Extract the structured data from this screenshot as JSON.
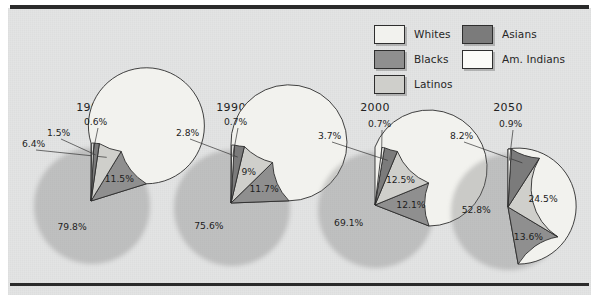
{
  "figure": {
    "background_color": "#e3e4e4",
    "rule_color": "#2b2b2b"
  },
  "legend": {
    "position": "top-right",
    "columns": [
      {
        "items": [
          {
            "label": "Whites",
            "color": "#f2f2ee",
            "name": "whites"
          },
          {
            "label": "Blacks",
            "color": "#8f8f8f",
            "name": "blacks"
          },
          {
            "label": "Latinos",
            "color": "#cfcfcb",
            "name": "latinos"
          }
        ]
      },
      {
        "items": [
          {
            "label": "Asians",
            "color": "#7b7b7b",
            "name": "asians"
          },
          {
            "label": "Am. Indians",
            "color": "#fbfbf8",
            "name": "am-indians"
          }
        ]
      }
    ]
  },
  "chart_data": {
    "type": "pie",
    "title": "",
    "subtitle": "",
    "xlabel": "",
    "ylabel": "",
    "grid": false,
    "legend_position": "top-right",
    "units": "percent",
    "categories": [
      "Whites",
      "Blacks",
      "Latinos",
      "Asians",
      "Am. Indians"
    ],
    "category_colors": {
      "Whites": "#f2f2ee",
      "Blacks": "#8f8f8f",
      "Latinos": "#cfcfcb",
      "Asians": "#7b7b7b",
      "Am. Indians": "#fbfbf8"
    },
    "charts": [
      {
        "title": "1980",
        "slices": [
          {
            "category": "Whites",
            "value": 79.8,
            "label": "79.8%",
            "label_placement": "inside"
          },
          {
            "category": "Blacks",
            "value": 11.5,
            "label": "11.5%",
            "label_placement": "inside"
          },
          {
            "category": "Latinos",
            "value": 6.4,
            "label": "6.4%",
            "label_placement": "outside"
          },
          {
            "category": "Asians",
            "value": 1.5,
            "label": "1.5%",
            "label_placement": "outside"
          },
          {
            "category": "Am. Indians",
            "value": 0.6,
            "label": "0.6%",
            "label_placement": "outside"
          }
        ]
      },
      {
        "title": "1990",
        "slices": [
          {
            "category": "Whites",
            "value": 75.6,
            "label": "75.6%",
            "label_placement": "inside"
          },
          {
            "category": "Blacks",
            "value": 11.7,
            "label": "11.7%",
            "label_placement": "inside"
          },
          {
            "category": "Latinos",
            "value": 9.0,
            "label": "9%",
            "label_placement": "inside"
          },
          {
            "category": "Asians",
            "value": 2.8,
            "label": "2.8%",
            "label_placement": "outside"
          },
          {
            "category": "Am. Indians",
            "value": 0.7,
            "label": "0.7%",
            "label_placement": "outside"
          }
        ]
      },
      {
        "title": "2000",
        "slices": [
          {
            "category": "Whites",
            "value": 69.1,
            "label": "69.1%",
            "label_placement": "inside"
          },
          {
            "category": "Blacks",
            "value": 12.1,
            "label": "12.1%",
            "label_placement": "inside"
          },
          {
            "category": "Latinos",
            "value": 12.5,
            "label": "12.5%",
            "label_placement": "inside"
          },
          {
            "category": "Asians",
            "value": 3.7,
            "label": "3.7%",
            "label_placement": "outside"
          },
          {
            "category": "Am. Indians",
            "value": 0.7,
            "label": "0.7%",
            "label_placement": "outside"
          }
        ]
      },
      {
        "title": "2050",
        "slices": [
          {
            "category": "Whites",
            "value": 52.8,
            "label": "52.8%",
            "label_placement": "inside"
          },
          {
            "category": "Blacks",
            "value": 13.6,
            "label": "13.6%",
            "label_placement": "inside"
          },
          {
            "category": "Latinos",
            "value": 24.5,
            "label": "24.5%",
            "label_placement": "inside"
          },
          {
            "category": "Asians",
            "value": 8.2,
            "label": "8.2%",
            "label_placement": "outside"
          },
          {
            "category": "Am. Indians",
            "value": 0.9,
            "label": "0.9%",
            "label_placement": "outside"
          }
        ]
      }
    ]
  }
}
